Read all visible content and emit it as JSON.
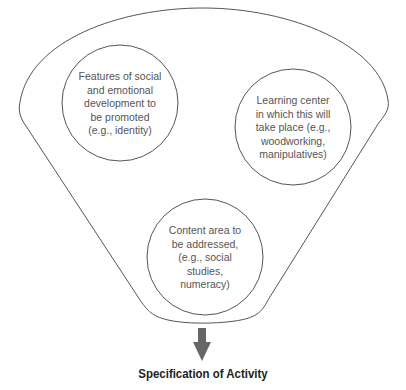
{
  "diagram": {
    "type": "funnel",
    "colors": {
      "stroke": "#555555",
      "arrow": "#666666",
      "text": "#555555",
      "caption": "#222222"
    },
    "circles": [
      {
        "id": "social-emotional",
        "text": "Features of social\nand emotional\ndevelopment to\nbe promoted\n(e.g., identity)"
      },
      {
        "id": "learning-center",
        "text": "Learning center\nin which this will\ntake place (e.g.,\nwoodworking,\nmanipulatives)"
      },
      {
        "id": "content-area",
        "text": "Content area to\nbe addressed,\n(e.g., social\nstudies,\nnumeracy)"
      }
    ],
    "output_label": "Specification of Activity"
  }
}
